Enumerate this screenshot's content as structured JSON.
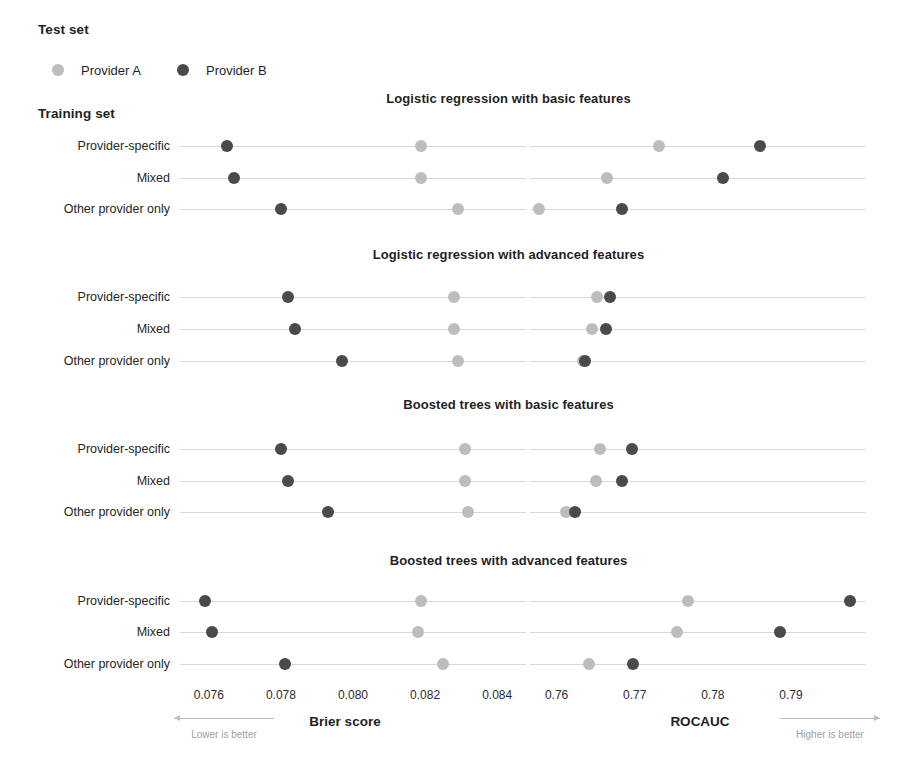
{
  "legend": {
    "title": "Test set",
    "entries": [
      {
        "label": "Provider A",
        "color": "#bdbdbd",
        "key": "provider_a"
      },
      {
        "label": "Provider B",
        "color": "#4a4a4a",
        "key": "provider_b"
      }
    ]
  },
  "y_axis": {
    "title": "Training set",
    "categories": [
      "Provider-specific",
      "Mixed",
      "Other provider only"
    ]
  },
  "axes": {
    "brier": {
      "name": "Brier score",
      "ticks": [
        "0.076",
        "0.078",
        "0.080",
        "0.082",
        "0.084"
      ],
      "tick_values": [
        0.076,
        0.078,
        0.08,
        0.082,
        0.084
      ],
      "range": [
        0.0752,
        0.0848
      ],
      "hint": "Lower is better",
      "hint_direction": "left"
    },
    "rocauc": {
      "name": "ROCAUC",
      "ticks": [
        "0.76",
        "0.77",
        "0.78",
        "0.79"
      ],
      "tick_values": [
        0.76,
        0.77,
        0.78,
        0.79
      ],
      "range": [
        0.7566,
        0.7996
      ],
      "hint": "Higher is better",
      "hint_direction": "right"
    }
  },
  "chart_data": {
    "type": "scatter",
    "xlabel": "Brier score / ROCAUC",
    "ylabel": "Training set",
    "grid": true,
    "legend_position": "top-left",
    "categories": [
      "Provider-specific",
      "Mixed",
      "Other provider only"
    ],
    "panels": [
      {
        "title": "Logistic regression with basic features",
        "metrics": {
          "brier": {
            "provider_a": [
              0.0819,
              0.0819,
              0.0829
            ],
            "provider_b": [
              0.0765,
              0.0767,
              0.078
            ]
          },
          "rocauc": {
            "provider_a": [
              0.7731,
              0.7664,
              0.7577
            ],
            "provider_b": [
              0.786,
              0.7813,
              0.7684
            ]
          }
        }
      },
      {
        "title": "Logistic regression with advanced features",
        "metrics": {
          "brier": {
            "provider_a": [
              0.0828,
              0.0828,
              0.0829
            ],
            "provider_b": [
              0.0782,
              0.0784,
              0.0797
            ]
          },
          "rocauc": {
            "provider_a": [
              0.7652,
              0.7645,
              0.7634
            ],
            "provider_b": [
              0.7668,
              0.7663,
              0.7637
            ]
          }
        }
      },
      {
        "title": "Boosted trees with basic features",
        "metrics": {
          "brier": {
            "provider_a": [
              0.0831,
              0.0831,
              0.0832
            ],
            "provider_b": [
              0.078,
              0.0782,
              0.0793
            ]
          },
          "rocauc": {
            "provider_a": [
              0.7656,
              0.765,
              0.7612
            ],
            "provider_b": [
              0.7697,
              0.7684,
              0.7624
            ]
          }
        }
      },
      {
        "title": "Boosted trees with advanced features",
        "metrics": {
          "brier": {
            "provider_a": [
              0.0819,
              0.0818,
              0.0825
            ],
            "provider_b": [
              0.0759,
              0.0761,
              0.0781
            ]
          },
          "rocauc": {
            "provider_a": [
              0.7768,
              0.7754,
              0.7642
            ],
            "provider_b": [
              0.7975,
              0.7886,
              0.7698
            ]
          }
        }
      }
    ]
  }
}
